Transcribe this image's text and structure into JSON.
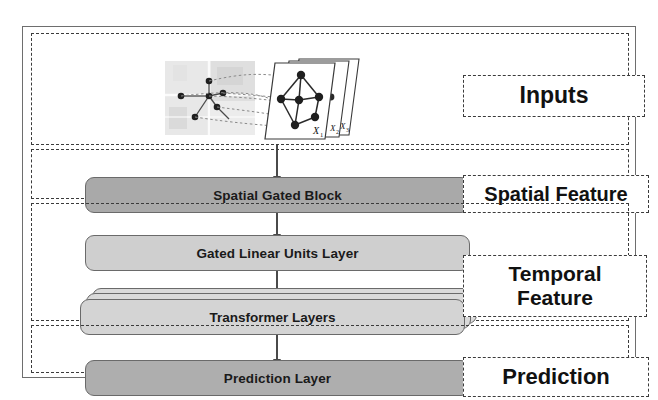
{
  "figure": {
    "type": "block-diagram",
    "flow_direction": "top-to-bottom"
  },
  "sections": [
    {
      "id": "inputs",
      "label": "Inputs"
    },
    {
      "id": "spatial",
      "label": "Spatial Feature"
    },
    {
      "id": "temporal",
      "label_line1": "Temporal",
      "label_line2": "Feature"
    },
    {
      "id": "prediction",
      "label": "Prediction"
    }
  ],
  "blocks": [
    {
      "id": "spatial-gated-block",
      "label": "Spatial Gated Block",
      "fill": "#a9a9a9"
    },
    {
      "id": "gated-linear-units-layer",
      "label": "Gated Linear Units Layer",
      "fill": "#cfcfcf"
    },
    {
      "id": "transformer-layers",
      "label": "Transformer Layers",
      "fill": "#d4d4d4",
      "stacked": true,
      "stack_count": 3
    },
    {
      "id": "prediction-layer",
      "label": "Prediction Layer",
      "fill": "#aeaeae"
    }
  ],
  "input_illustration": {
    "description": "road-network map whose sensor nodes map onto a stack of graph snapshots",
    "graph_snapshot_labels": [
      "X₁",
      "X₂",
      "X₃"
    ],
    "graph_node_count": 6,
    "map_node_count": 6,
    "stack_count": 3
  },
  "colors": {
    "frame_border": "#6e6e6e",
    "dashed_border": "#3b3b3b",
    "arrow": "#4a4a4a",
    "text": "#111111",
    "block_dark": "#a9a9a9",
    "block_light": "#cfcfcf"
  }
}
